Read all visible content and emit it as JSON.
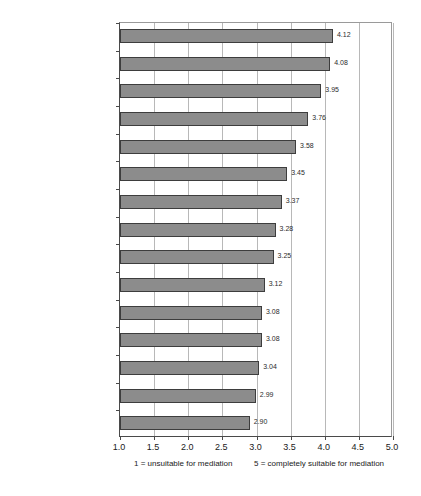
{
  "chart_data": {
    "type": "bar",
    "orientation": "horizontal",
    "title": "",
    "subtitle": "",
    "xlabel": "",
    "ylabel": "",
    "xlim": [
      1.0,
      5.0
    ],
    "xticks": [
      "1.0",
      "1.5",
      "2.0",
      "2.5",
      "3.0",
      "3.5",
      "4.0",
      "4.5",
      "5.0"
    ],
    "xtick_values": [
      1.0,
      1.5,
      2.0,
      2.5,
      3.0,
      3.5,
      4.0,
      4.5,
      5.0
    ],
    "grid": true,
    "grid_axis": "x",
    "legend": false,
    "bar_color": "#8c8c8c",
    "bar_border_color": "#3d3d3d",
    "categories": [
      "personality conflict",
      "employment/work",
      "pastoral breakdown",
      "church governance",
      "property ownership",
      "financial (non-criminal)",
      "contractual",
      "racial discrimination",
      "church buildings",
      "personal injury",
      "minor discipline",
      "defamation",
      "taxation",
      "gay and gender issue",
      "worship/doctrine"
    ],
    "values": [
      4.12,
      4.08,
      3.95,
      3.76,
      3.58,
      3.45,
      3.37,
      3.28,
      3.25,
      3.12,
      3.08,
      3.08,
      3.04,
      2.99,
      2.9
    ],
    "value_labels": [
      "4.12",
      "4.08",
      "3.95",
      "3.76",
      "3.58",
      "3.45",
      "3.37",
      "3.28",
      "3.25",
      "3.12",
      "3.08",
      "3.08",
      "3.04",
      "2.99",
      "2.90"
    ]
  },
  "footnotes": {
    "low": "1 = unsuitable for mediation",
    "high": "5 = completely suitable for mediation"
  }
}
